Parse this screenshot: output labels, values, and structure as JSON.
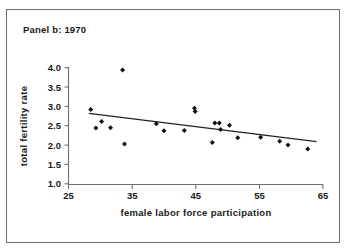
{
  "chart_data": {
    "type": "scatter",
    "title": "Panel b: 1970",
    "xlabel": "female labor force participation",
    "ylabel": "total fertility rate",
    "xlim": [
      25,
      65
    ],
    "ylim": [
      1.0,
      4.0
    ],
    "xticks": [
      25,
      35,
      45,
      55,
      65
    ],
    "xticklabels": [
      "25",
      "35",
      "45",
      "55",
      "65"
    ],
    "yticks": [
      1.0,
      1.5,
      2.0,
      2.5,
      3.0,
      3.5,
      4.0
    ],
    "yticklabels": [
      "1.0",
      "1.5",
      "2.0",
      "2.5",
      "3.0",
      "3.5",
      "4.0"
    ],
    "grid": false,
    "legend": false,
    "series": [
      {
        "name": "countries",
        "marker": "diamond",
        "points": [
          {
            "x": 28.5,
            "y": 2.92
          },
          {
            "x": 29.3,
            "y": 2.44
          },
          {
            "x": 30.2,
            "y": 2.61
          },
          {
            "x": 31.6,
            "y": 2.45
          },
          {
            "x": 33.5,
            "y": 3.94
          },
          {
            "x": 33.8,
            "y": 2.03
          },
          {
            "x": 38.8,
            "y": 2.55
          },
          {
            "x": 40.0,
            "y": 2.37
          },
          {
            "x": 43.2,
            "y": 2.38
          },
          {
            "x": 44.8,
            "y": 2.95
          },
          {
            "x": 44.9,
            "y": 2.87
          },
          {
            "x": 47.6,
            "y": 2.07
          },
          {
            "x": 48.0,
            "y": 2.57
          },
          {
            "x": 48.7,
            "y": 2.57
          },
          {
            "x": 48.9,
            "y": 2.4
          },
          {
            "x": 50.3,
            "y": 2.51
          },
          {
            "x": 51.6,
            "y": 2.19
          },
          {
            "x": 55.2,
            "y": 2.2
          },
          {
            "x": 58.2,
            "y": 2.1
          },
          {
            "x": 59.5,
            "y": 2.0
          },
          {
            "x": 62.6,
            "y": 1.9
          }
        ]
      }
    ],
    "trendline": {
      "name": "fitted regression line",
      "x_start": 28.2,
      "y_start": 2.82,
      "x_end": 64.0,
      "y_end": 2.09
    }
  }
}
